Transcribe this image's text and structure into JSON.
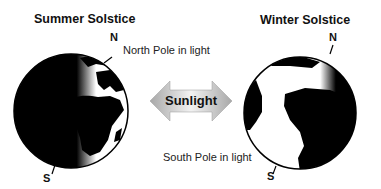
{
  "left_globe": {
    "title": "Summer Solstice",
    "north_label": "N",
    "south_label": "S",
    "annotation": "North Pole in light"
  },
  "right_globe": {
    "title": "Winter Solstice",
    "north_label": "N",
    "south_label": "S",
    "annotation": "South Pole in light"
  },
  "center_arrow": {
    "label": "Sunlight"
  },
  "colors": {
    "night": "#000000",
    "day": "#ffffff",
    "arrow": "#b0b0b0"
  }
}
